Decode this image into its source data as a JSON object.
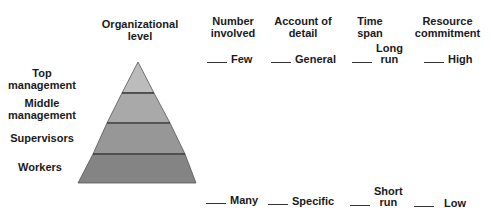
{
  "columns": [
    {
      "label_line1": "Organizational",
      "label_line2": "level"
    },
    {
      "label_line1": "Number",
      "label_line2": "involved"
    },
    {
      "label_line1": "Account of",
      "label_line2": "detail"
    },
    {
      "label_line1": "Time",
      "label_line2": "span"
    },
    {
      "label_line1": "Resource",
      "label_line2": "commitment"
    }
  ],
  "levels": [
    {
      "line1": "Top",
      "line2": "management",
      "color": "#bcbcbc"
    },
    {
      "line1": "Middle",
      "line2": "management",
      "color": "#a9a9a9"
    },
    {
      "line1": "Supervisors",
      "line2": "",
      "color": "#979797"
    },
    {
      "line1": "Workers",
      "line2": "",
      "color": "#848484"
    }
  ],
  "top_row": {
    "number_involved": "Few",
    "account_of_detail": "General",
    "time_span_line1": "Long",
    "time_span_line2": "run",
    "resource_commitment": "High"
  },
  "bottom_row": {
    "number_involved": "Many",
    "account_of_detail": "Specific",
    "time_span_line1": "Short",
    "time_span_line2": "run",
    "resource_commitment": "Low"
  },
  "colors": {
    "outline": "#3a3a3a",
    "text": "#1a1a1a"
  }
}
